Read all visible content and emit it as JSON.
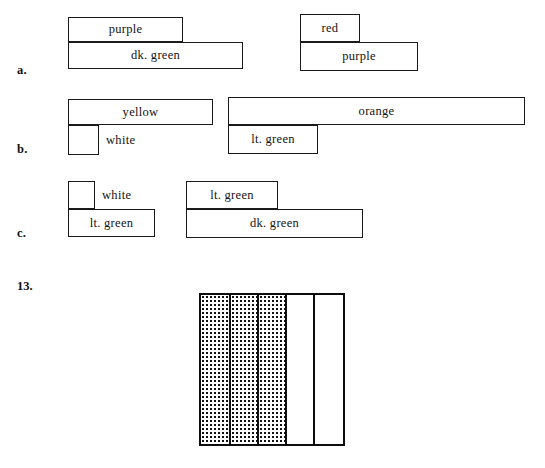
{
  "page": {
    "width": 545,
    "height": 468,
    "background": "#ffffff",
    "ink_color": "#131313"
  },
  "rows": [
    {
      "marker": "a.",
      "marker_x": 17,
      "marker_y": 64,
      "groups": [
        {
          "name": "group-a-left",
          "bars": [
            {
              "label": "purple",
              "x": 68,
              "y": 17,
              "width": 115,
              "height": 25,
              "label_outside": false
            },
            {
              "label": "dk. green",
              "x": 68,
              "y": 42,
              "width": 175,
              "height": 27,
              "label_outside": false
            }
          ]
        },
        {
          "name": "group-a-right",
          "bars": [
            {
              "label": "red",
              "x": 300,
              "y": 14,
              "width": 60,
              "height": 28,
              "label_outside": false
            },
            {
              "label": "purple",
              "x": 300,
              "y": 42,
              "width": 118,
              "height": 29,
              "label_outside": false
            }
          ]
        }
      ]
    },
    {
      "marker": "b.",
      "marker_x": 17,
      "marker_y": 143,
      "groups": [
        {
          "name": "group-b-left",
          "bars": [
            {
              "label": "yellow",
              "x": 68,
              "y": 99,
              "width": 145,
              "height": 26,
              "label_outside": false
            },
            {
              "label": "white",
              "x": 68,
              "y": 125,
              "width": 31,
              "height": 30,
              "label_outside": true
            }
          ]
        },
        {
          "name": "group-b-right",
          "bars": [
            {
              "label": "orange",
              "x": 228,
              "y": 97,
              "width": 297,
              "height": 28,
              "label_outside": false
            },
            {
              "label": "lt. green",
              "x": 228,
              "y": 125,
              "width": 90,
              "height": 29,
              "label_outside": false
            }
          ]
        }
      ]
    },
    {
      "marker": "c.",
      "marker_x": 17,
      "marker_y": 227,
      "groups": [
        {
          "name": "group-c-left",
          "bars": [
            {
              "label": "white",
              "x": 68,
              "y": 181,
              "width": 27,
              "height": 28,
              "label_outside": true
            },
            {
              "label": "lt. green",
              "x": 68,
              "y": 209,
              "width": 87,
              "height": 28,
              "label_outside": false
            }
          ]
        },
        {
          "name": "group-c-right",
          "bars": [
            {
              "label": "lt. green",
              "x": 186,
              "y": 181,
              "width": 92,
              "height": 28,
              "label_outside": false
            },
            {
              "label": "dk. green",
              "x": 186,
              "y": 209,
              "width": 177,
              "height": 29,
              "label_outside": false
            }
          ]
        }
      ]
    }
  ],
  "problem_13": {
    "number": "13.",
    "number_x": 17,
    "number_y": 280,
    "figure": {
      "x": 199,
      "y": 293,
      "width": 146,
      "height": 153,
      "border_color": "#0d0d0d",
      "columns": [
        {
          "fill": "dotted",
          "width": 28
        },
        {
          "fill": "dotted",
          "width": 28
        },
        {
          "fill": "dotted",
          "width": 28
        },
        {
          "fill": "plain",
          "width": 28
        },
        {
          "fill": "plain",
          "width": 30
        }
      ]
    }
  }
}
